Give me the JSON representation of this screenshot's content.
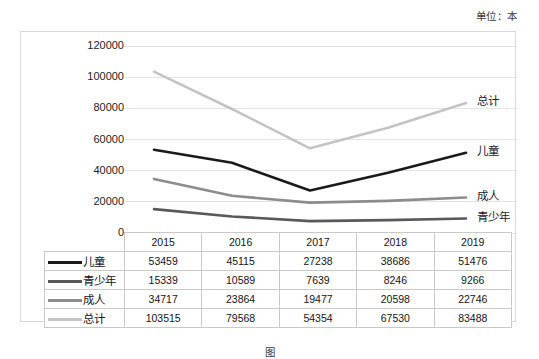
{
  "unit_note": "单位：本",
  "figure_caption": "图",
  "chart_data": {
    "type": "line",
    "title": "",
    "subtitle": "",
    "xlabel": "",
    "ylabel": "",
    "unit_note": "单位：本",
    "categories": [
      "2015",
      "2016",
      "2017",
      "2018",
      "2019"
    ],
    "ylim": [
      0,
      120000
    ],
    "ytick_labels": [
      "0",
      "20000",
      "40000",
      "60000",
      "80000",
      "100000",
      "120000"
    ],
    "ytick_values": [
      0,
      20000,
      40000,
      60000,
      80000,
      100000,
      120000
    ],
    "grid": true,
    "legend_position": "table-below",
    "series": [
      {
        "name": "儿童",
        "label": "儿童",
        "color": "#1a1a1a",
        "values": [
          53459,
          45115,
          27238,
          38686,
          51476
        ]
      },
      {
        "name": "青少年",
        "label": "青少年",
        "color": "#595959",
        "values": [
          15339,
          10589,
          7639,
          8246,
          9266
        ]
      },
      {
        "name": "成人",
        "label": "成人",
        "color": "#8c8c8c",
        "values": [
          34717,
          23864,
          19477,
          20598,
          22746
        ]
      },
      {
        "name": "总计",
        "label": "总计",
        "color": "#c4c4c4",
        "values": [
          103515,
          79568,
          54354,
          67530,
          83488
        ]
      }
    ]
  },
  "table": {
    "corner_label": "",
    "column_headers": [
      "2015",
      "2016",
      "2017",
      "2018",
      "2019"
    ],
    "rows": [
      {
        "label": "儿童",
        "color": "#1a1a1a",
        "values": [
          "53459",
          "45115",
          "27238",
          "38686",
          "51476"
        ]
      },
      {
        "label": "青少年",
        "color": "#595959",
        "values": [
          "15339",
          "10589",
          "7639",
          "8246",
          "9266"
        ]
      },
      {
        "label": "成人",
        "color": "#8c8c8c",
        "values": [
          "34717",
          "23864",
          "19477",
          "20598",
          "22746"
        ]
      },
      {
        "label": "总计",
        "color": "#c4c4c4",
        "values": [
          "103515",
          "79568",
          "54354",
          "67530",
          "83488"
        ]
      }
    ]
  },
  "colors": {
    "grid": "#e4e4e4",
    "frame": "#d9d9d9",
    "text": "#1a1a1a"
  }
}
